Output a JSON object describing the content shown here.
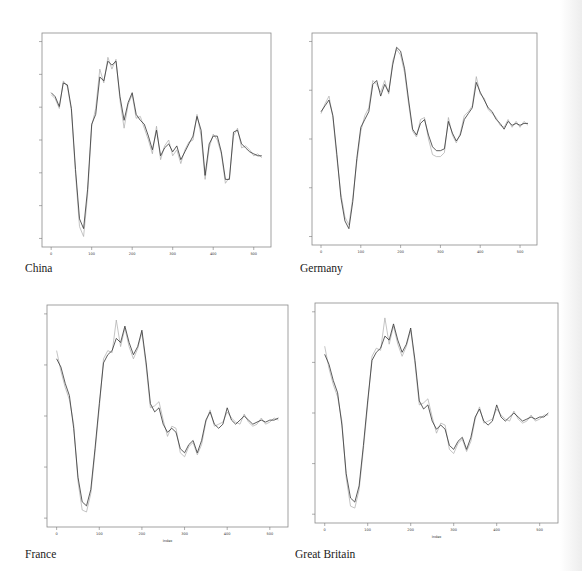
{
  "page": {
    "background": "#ffffff"
  },
  "chart_data": [
    {
      "type": "line",
      "title": "China",
      "xlabel": "",
      "ylabel": "",
      "xlim": [
        0,
        520
      ],
      "x_ticks": [
        0,
        100,
        200,
        300,
        400,
        500
      ],
      "y_ticks_count": 7,
      "grid": false,
      "series": [
        {
          "name": "actual",
          "color": "#333333",
          "x": [
            0,
            10,
            20,
            30,
            40,
            50,
            60,
            70,
            80,
            90,
            100,
            110,
            120,
            130,
            140,
            150,
            160,
            170,
            180,
            190,
            200,
            210,
            220,
            230,
            240,
            250,
            260,
            270,
            280,
            290,
            300,
            310,
            320,
            330,
            340,
            350,
            360,
            370,
            380,
            390,
            400,
            410,
            420,
            430,
            440,
            450,
            460,
            470,
            480,
            490,
            500,
            510,
            520
          ],
          "y": [
            0.74,
            0.72,
            0.67,
            0.79,
            0.78,
            0.66,
            0.35,
            0.1,
            0.05,
            0.25,
            0.58,
            0.63,
            0.82,
            0.8,
            0.9,
            0.88,
            0.9,
            0.72,
            0.6,
            0.69,
            0.74,
            0.63,
            0.6,
            0.58,
            0.52,
            0.45,
            0.55,
            0.42,
            0.46,
            0.48,
            0.44,
            0.47,
            0.4,
            0.44,
            0.48,
            0.52,
            0.62,
            0.55,
            0.32,
            0.48,
            0.52,
            0.52,
            0.44,
            0.3,
            0.3,
            0.54,
            0.55,
            0.48,
            0.46,
            0.44,
            0.43,
            0.42,
            0.42
          ]
        },
        {
          "name": "fitted",
          "color": "#aaaaaa",
          "x": [
            0,
            10,
            20,
            30,
            40,
            50,
            60,
            70,
            80,
            90,
            100,
            110,
            120,
            130,
            140,
            150,
            160,
            170,
            180,
            190,
            200,
            210,
            220,
            230,
            240,
            250,
            260,
            270,
            280,
            290,
            300,
            310,
            320,
            330,
            340,
            350,
            360,
            370,
            380,
            390,
            400,
            410,
            420,
            430,
            440,
            450,
            460,
            470,
            480,
            490,
            500,
            510,
            520
          ],
          "y": [
            0.73,
            0.71,
            0.66,
            0.8,
            0.77,
            0.65,
            0.33,
            0.06,
            0.01,
            0.22,
            0.57,
            0.66,
            0.86,
            0.79,
            0.92,
            0.86,
            0.91,
            0.7,
            0.56,
            0.68,
            0.73,
            0.61,
            0.62,
            0.56,
            0.5,
            0.43,
            0.57,
            0.4,
            0.47,
            0.5,
            0.42,
            0.45,
            0.38,
            0.45,
            0.49,
            0.5,
            0.63,
            0.52,
            0.3,
            0.46,
            0.53,
            0.5,
            0.43,
            0.28,
            0.31,
            0.52,
            0.56,
            0.46,
            0.47,
            0.45,
            0.42,
            0.43,
            0.41
          ]
        }
      ]
    },
    {
      "type": "line",
      "title": "Germany",
      "xlabel": "",
      "ylabel": "",
      "xlim": [
        0,
        520
      ],
      "x_ticks": [
        0,
        100,
        200,
        300,
        400,
        500
      ],
      "y_ticks_count": 5,
      "grid": false,
      "series": [
        {
          "name": "actual",
          "color": "#333333",
          "x": [
            0,
            10,
            20,
            30,
            40,
            50,
            60,
            70,
            80,
            90,
            100,
            110,
            120,
            130,
            140,
            150,
            160,
            170,
            180,
            190,
            200,
            210,
            220,
            230,
            240,
            250,
            260,
            270,
            280,
            290,
            300,
            310,
            320,
            330,
            340,
            350,
            360,
            370,
            380,
            390,
            400,
            410,
            420,
            430,
            440,
            450,
            460,
            470,
            480,
            490,
            500,
            510,
            520
          ],
          "y": [
            0.64,
            0.67,
            0.7,
            0.62,
            0.42,
            0.2,
            0.08,
            0.04,
            0.18,
            0.4,
            0.56,
            0.6,
            0.64,
            0.78,
            0.8,
            0.72,
            0.78,
            0.74,
            0.88,
            0.97,
            0.95,
            0.86,
            0.7,
            0.55,
            0.52,
            0.58,
            0.6,
            0.52,
            0.46,
            0.44,
            0.44,
            0.45,
            0.59,
            0.53,
            0.49,
            0.52,
            0.6,
            0.63,
            0.66,
            0.79,
            0.74,
            0.7,
            0.66,
            0.64,
            0.6,
            0.58,
            0.55,
            0.59,
            0.57,
            0.58,
            0.57,
            0.58,
            0.58
          ]
        },
        {
          "name": "fitted",
          "color": "#aaaaaa",
          "x": [
            0,
            10,
            20,
            30,
            40,
            50,
            60,
            70,
            80,
            90,
            100,
            110,
            120,
            130,
            140,
            150,
            160,
            170,
            180,
            190,
            200,
            210,
            220,
            230,
            240,
            250,
            260,
            270,
            280,
            290,
            300,
            310,
            320,
            330,
            340,
            350,
            360,
            370,
            380,
            390,
            400,
            410,
            420,
            430,
            440,
            450,
            460,
            470,
            480,
            490,
            500,
            510,
            520
          ],
          "y": [
            0.63,
            0.68,
            0.72,
            0.61,
            0.4,
            0.22,
            0.1,
            0.06,
            0.2,
            0.38,
            0.54,
            0.62,
            0.66,
            0.8,
            0.78,
            0.74,
            0.8,
            0.73,
            0.9,
            0.96,
            0.93,
            0.84,
            0.68,
            0.54,
            0.51,
            0.6,
            0.61,
            0.5,
            0.42,
            0.41,
            0.41,
            0.43,
            0.61,
            0.52,
            0.48,
            0.53,
            0.62,
            0.64,
            0.67,
            0.82,
            0.73,
            0.71,
            0.65,
            0.63,
            0.61,
            0.57,
            0.56,
            0.6,
            0.56,
            0.59,
            0.56,
            0.59,
            0.57
          ]
        }
      ]
    },
    {
      "type": "line",
      "title": "France",
      "xlabel": "Index",
      "ylabel": "",
      "xlim": [
        0,
        520
      ],
      "x_ticks": [
        0,
        100,
        200,
        300,
        400,
        500
      ],
      "y_ticks_count": 5,
      "grid": false,
      "series": [
        {
          "name": "actual",
          "color": "#333333",
          "x": [
            0,
            10,
            20,
            30,
            40,
            50,
            60,
            70,
            80,
            90,
            100,
            110,
            120,
            130,
            140,
            150,
            160,
            170,
            180,
            190,
            200,
            210,
            220,
            230,
            240,
            250,
            260,
            270,
            280,
            290,
            300,
            310,
            320,
            330,
            340,
            350,
            360,
            370,
            380,
            390,
            400,
            410,
            420,
            430,
            440,
            450,
            460,
            470,
            480,
            490,
            500,
            510,
            520
          ],
          "y": [
            0.78,
            0.74,
            0.66,
            0.6,
            0.44,
            0.2,
            0.08,
            0.06,
            0.14,
            0.34,
            0.56,
            0.76,
            0.8,
            0.82,
            0.88,
            0.86,
            0.94,
            0.86,
            0.8,
            0.84,
            0.92,
            0.76,
            0.56,
            0.52,
            0.54,
            0.46,
            0.42,
            0.44,
            0.42,
            0.34,
            0.32,
            0.36,
            0.38,
            0.32,
            0.38,
            0.48,
            0.52,
            0.46,
            0.44,
            0.46,
            0.54,
            0.48,
            0.46,
            0.48,
            0.5,
            0.48,
            0.46,
            0.47,
            0.48,
            0.47,
            0.48,
            0.48,
            0.49
          ]
        },
        {
          "name": "fitted",
          "color": "#aaaaaa",
          "x": [
            0,
            10,
            20,
            30,
            40,
            50,
            60,
            70,
            80,
            90,
            100,
            110,
            120,
            130,
            140,
            150,
            160,
            170,
            180,
            190,
            200,
            210,
            220,
            230,
            240,
            250,
            260,
            270,
            280,
            290,
            300,
            310,
            320,
            330,
            340,
            350,
            360,
            370,
            380,
            390,
            400,
            410,
            420,
            430,
            440,
            450,
            460,
            470,
            480,
            490,
            500,
            510,
            520
          ],
          "y": [
            0.82,
            0.72,
            0.64,
            0.58,
            0.46,
            0.18,
            0.04,
            0.03,
            0.12,
            0.32,
            0.54,
            0.78,
            0.82,
            0.81,
            0.97,
            0.84,
            0.93,
            0.84,
            0.78,
            0.83,
            0.91,
            0.74,
            0.54,
            0.55,
            0.57,
            0.48,
            0.4,
            0.45,
            0.44,
            0.32,
            0.3,
            0.35,
            0.37,
            0.31,
            0.36,
            0.47,
            0.53,
            0.45,
            0.46,
            0.47,
            0.52,
            0.49,
            0.47,
            0.46,
            0.51,
            0.47,
            0.45,
            0.46,
            0.49,
            0.46,
            0.47,
            0.49,
            0.48
          ]
        }
      ]
    },
    {
      "type": "line",
      "title": "Great Britain",
      "xlabel": "Index",
      "ylabel": "",
      "xlim": [
        0,
        520
      ],
      "x_ticks": [
        0,
        100,
        200,
        300,
        400,
        500
      ],
      "y_ticks_count": 5,
      "grid": false,
      "series": [
        {
          "name": "actual",
          "color": "#333333",
          "x": [
            0,
            10,
            20,
            30,
            40,
            50,
            60,
            70,
            80,
            90,
            100,
            110,
            120,
            130,
            140,
            150,
            160,
            170,
            180,
            190,
            200,
            210,
            220,
            230,
            240,
            250,
            260,
            270,
            280,
            290,
            300,
            310,
            320,
            330,
            340,
            350,
            360,
            370,
            380,
            390,
            400,
            410,
            420,
            430,
            440,
            450,
            460,
            470,
            480,
            490,
            500,
            510,
            520
          ],
          "y": [
            0.79,
            0.74,
            0.66,
            0.6,
            0.44,
            0.2,
            0.08,
            0.06,
            0.14,
            0.34,
            0.56,
            0.76,
            0.8,
            0.82,
            0.88,
            0.86,
            0.94,
            0.86,
            0.8,
            0.84,
            0.92,
            0.76,
            0.56,
            0.52,
            0.54,
            0.46,
            0.42,
            0.44,
            0.42,
            0.34,
            0.32,
            0.36,
            0.38,
            0.32,
            0.38,
            0.48,
            0.52,
            0.46,
            0.44,
            0.46,
            0.54,
            0.48,
            0.46,
            0.48,
            0.5,
            0.48,
            0.46,
            0.47,
            0.48,
            0.47,
            0.48,
            0.48,
            0.5
          ]
        },
        {
          "name": "fitted",
          "color": "#aaaaaa",
          "x": [
            0,
            10,
            20,
            30,
            40,
            50,
            60,
            70,
            80,
            90,
            100,
            110,
            120,
            130,
            140,
            150,
            160,
            170,
            180,
            190,
            200,
            210,
            220,
            230,
            240,
            250,
            260,
            270,
            280,
            290,
            300,
            310,
            320,
            330,
            340,
            350,
            360,
            370,
            380,
            390,
            400,
            410,
            420,
            430,
            440,
            450,
            460,
            470,
            480,
            490,
            500,
            510,
            520
          ],
          "y": [
            0.83,
            0.72,
            0.64,
            0.58,
            0.46,
            0.18,
            0.04,
            0.03,
            0.12,
            0.32,
            0.54,
            0.78,
            0.82,
            0.81,
            0.97,
            0.84,
            0.93,
            0.84,
            0.78,
            0.83,
            0.91,
            0.74,
            0.54,
            0.55,
            0.57,
            0.48,
            0.4,
            0.45,
            0.44,
            0.32,
            0.3,
            0.35,
            0.37,
            0.31,
            0.36,
            0.47,
            0.53,
            0.45,
            0.46,
            0.47,
            0.52,
            0.49,
            0.47,
            0.46,
            0.51,
            0.47,
            0.45,
            0.46,
            0.49,
            0.46,
            0.47,
            0.49,
            0.49
          ]
        }
      ]
    }
  ],
  "captions": {
    "china": "China",
    "germany": "Germany",
    "france": "France",
    "great_britain": "Great Britain"
  }
}
